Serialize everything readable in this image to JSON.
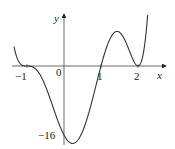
{
  "chart_data": {
    "type": "line",
    "title": "",
    "xlabel": "x",
    "ylabel": "y",
    "x_ticks": [
      {
        "value": -1,
        "label": "−1"
      },
      {
        "value": 0,
        "label": "0"
      },
      {
        "value": 1,
        "label": "1"
      },
      {
        "value": 2,
        "label": "2"
      }
    ],
    "y_ticks": [
      {
        "value": -16,
        "label": "−16"
      }
    ],
    "function": "4(x+1)^3(x-1)(x-2)^2",
    "series": [
      {
        "name": "f(x)",
        "x": [
          -1.35,
          -1.3,
          -1.2,
          -1.1,
          -1.0,
          -0.9,
          -0.8,
          -0.6,
          -0.4,
          -0.2,
          0.0,
          0.2,
          0.4,
          0.6,
          0.8,
          1.0,
          1.2,
          1.4,
          1.6,
          1.8,
          2.0,
          2.2,
          2.4,
          2.55
        ],
        "values": [
          10.4,
          7.4,
          3.3,
          0.8,
          0.0,
          -0.5,
          -1.5,
          -5.2,
          -10.0,
          -14.3,
          -16.0,
          -14.6,
          -10.5,
          -5.4,
          -1.4,
          0.0,
          1.5,
          1.6,
          1.0,
          0.3,
          0.0,
          0.5,
          3.1,
          9.5
        ]
      }
    ],
    "xlim": [
      -1.35,
      2.55
    ],
    "ylim": [
      -17.5,
      11
    ],
    "grid": false,
    "legend": "none",
    "annotations": []
  },
  "axes": {
    "x_label": "x",
    "y_label": "y",
    "origin_label": "0",
    "min_label": "−16",
    "tick_neg1": "−1",
    "tick_1": "1",
    "tick_2": "2"
  }
}
